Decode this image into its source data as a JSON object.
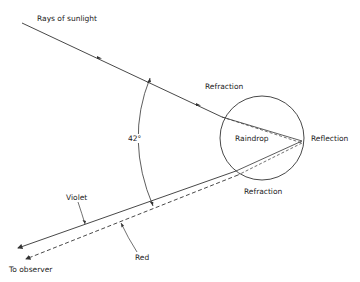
{
  "diagram": {
    "labels": {
      "sunlight": "Rays of sunlight",
      "refraction_in": "Refraction",
      "raindrop": "Raindrop",
      "reflection": "Reflection",
      "refraction_out": "Refraction",
      "angle": "42°",
      "violet": "Violet",
      "red": "Red",
      "observer": "To observer"
    },
    "colors": {
      "line": "#333333",
      "text": "#222222",
      "background": "#ffffff"
    },
    "rays": [
      {
        "name": "incoming-sunlight",
        "style": "solid"
      },
      {
        "name": "violet-ray",
        "style": "solid"
      },
      {
        "name": "red-ray",
        "style": "dashed"
      }
    ]
  }
}
